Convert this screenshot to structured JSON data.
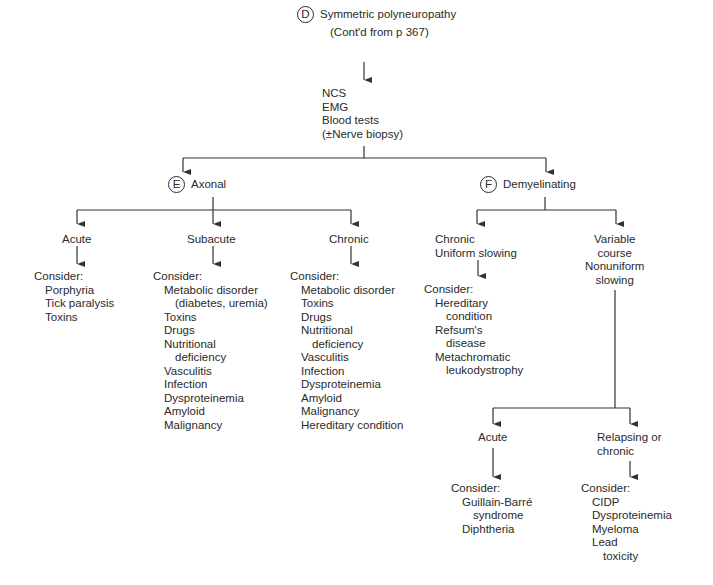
{
  "root": {
    "badge": "D",
    "title": "Symmetric polyneuropathy",
    "subtitle": "(Cont'd from p 367)"
  },
  "tests": [
    "NCS",
    "EMG",
    "Blood tests",
    "(±Nerve biopsy)"
  ],
  "axonal": {
    "badge": "E",
    "label": "Axonal",
    "branches": [
      {
        "label": "Acute",
        "consider": "Consider:",
        "items": [
          "Porphyria",
          "Tick paralysis",
          "Toxins"
        ]
      },
      {
        "label": "Subacute",
        "consider": "Consider:",
        "items": [
          "Metabolic disorder",
          "(diabetes, uremia)",
          "Toxins",
          "Drugs",
          "Nutritional",
          "deficiency",
          "Vasculitis",
          "Infection",
          "Dysproteinemia",
          "Amyloid",
          "Malignancy"
        ]
      },
      {
        "label": "Chronic",
        "consider": "Consider:",
        "items": [
          "Metabolic disorder",
          "Toxins",
          "Drugs",
          "Nutritional",
          "deficiency",
          "Vasculitis",
          "Infection",
          "Dysproteinemia",
          "Amyloid",
          "Malignancy",
          "Hereditary condition"
        ]
      }
    ]
  },
  "demyelinating": {
    "badge": "F",
    "label": "Demyelinating",
    "uniform": {
      "label_lines": [
        "Chronic",
        "Uniform slowing"
      ],
      "consider": "Consider:",
      "items": [
        "Hereditary",
        "condition",
        "Refsum's",
        "disease",
        "Metachromatic",
        "leukodystrophy"
      ]
    },
    "variable": {
      "label_lines": [
        "Variable",
        "course",
        "Nonuniform",
        "slowing"
      ],
      "acute": {
        "label": "Acute",
        "consider": "Consider:",
        "items": [
          "Guillain-Barré",
          "syndrome",
          "Diphtheria"
        ]
      },
      "relapsing": {
        "label_lines": [
          "Relapsing or",
          "chronic"
        ],
        "consider": "Consider:",
        "items": [
          "CIDP",
          "Dysproteinemia",
          "Myeloma",
          "Lead",
          "toxicity"
        ]
      }
    }
  }
}
